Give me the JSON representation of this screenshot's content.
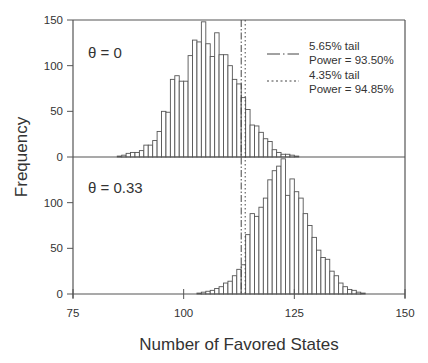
{
  "chart_data": {
    "type": "bar",
    "title": "",
    "xlabel": "Number of Favored States",
    "ylabel": "Frequency",
    "xlim": [
      75,
      150
    ],
    "x_ticks": [
      75,
      100,
      125,
      150
    ],
    "ylim": [
      0,
      150
    ],
    "y_ticks": [
      0,
      50,
      100,
      150
    ],
    "grid": false,
    "legend_position": "upper right (top panel)",
    "legend": [
      {
        "style": "dash-dot",
        "line1": "5.65% tail",
        "line2": "Power = 93.50%"
      },
      {
        "style": "dotted",
        "line1": "4.35% tail",
        "line2": "Power = 94.85%"
      }
    ],
    "vlines": [
      {
        "x": 113.0,
        "style": "dash-dot",
        "label": "5.65% tail"
      },
      {
        "x": 113.9,
        "style": "dotted",
        "label": "4.35% tail"
      }
    ],
    "panels": [
      {
        "label": "θ = 0",
        "bins": [
          85,
          86,
          87,
          88,
          89,
          90,
          91,
          92,
          93,
          94,
          95,
          96,
          97,
          98,
          99,
          100,
          101,
          102,
          103,
          104,
          105,
          106,
          107,
          108,
          109,
          110,
          111,
          112,
          113,
          114,
          115,
          116,
          117,
          118,
          119,
          120,
          121,
          122
        ],
        "values": [
          1,
          2,
          4,
          5,
          5,
          7,
          13,
          13,
          18,
          28,
          50,
          49,
          85,
          89,
          83,
          83,
          111,
          128,
          126,
          148,
          124,
          110,
          136,
          112,
          112,
          100,
          85,
          80,
          65,
          52,
          35,
          34,
          27,
          20,
          17,
          8,
          5,
          3,
          3,
          2,
          1
        ]
      },
      {
        "label": "θ = 0.33",
        "bins": [
          103,
          104,
          105,
          106,
          107,
          108,
          109,
          110,
          111,
          112,
          113,
          114,
          115,
          116,
          117,
          118,
          119,
          120,
          121,
          122,
          123,
          124,
          125,
          126,
          127,
          128,
          129,
          130,
          131,
          132,
          133,
          134,
          135,
          136,
          137,
          138,
          139,
          140,
          141
        ],
        "values": [
          1,
          2,
          3,
          4,
          6,
          8,
          12,
          14,
          20,
          27,
          32,
          65,
          88,
          85,
          95,
          105,
          125,
          135,
          140,
          148,
          108,
          126,
          112,
          105,
          88,
          75,
          62,
          48,
          40,
          38,
          25,
          20,
          12,
          8,
          5,
          4,
          2,
          1
        ]
      }
    ]
  },
  "labels": {
    "panel_top": "θ = 0",
    "panel_bottom": "θ = 0.33",
    "xlabel": "Number of Favored States",
    "ylabel": "Frequency",
    "legend1_line1": "5.65% tail",
    "legend1_line2": "Power = 93.50%",
    "legend2_line1": "4.35% tail",
    "legend2_line2": "Power = 94.85%"
  }
}
